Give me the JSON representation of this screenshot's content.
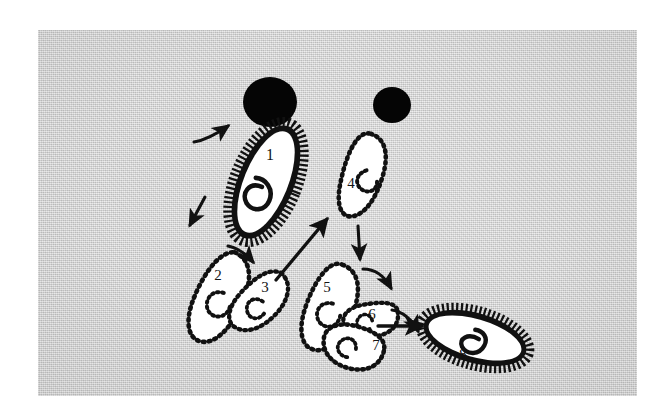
{
  "figure": {
    "kind": "micrograph-diagram",
    "background_color": "#cfcfcf",
    "ink_color": "#111111",
    "cell_fill_color": "#ffffff",
    "plate": {
      "x": 38,
      "y": 30,
      "width": 599,
      "height": 366
    }
  },
  "dark_bodies": [
    {
      "name": "dark-body-large",
      "label": "",
      "cx": 232,
      "cy": 72,
      "rx": 27,
      "ry": 25
    },
    {
      "name": "dark-body-small",
      "label": "",
      "cx": 354,
      "cy": 75,
      "rx": 19,
      "ry": 18
    }
  ],
  "cells": [
    {
      "id": 1,
      "label": "1",
      "border_style": "ciliated-solid",
      "label_x": 232,
      "label_y": 130,
      "description": "elongated ciliated cell with spiral macronucleus"
    },
    {
      "id": 2,
      "label": "2",
      "border_style": "dotted",
      "label_x": 180,
      "label_y": 250,
      "description": "dotted-outline dividing form, upper left of pair"
    },
    {
      "id": 3,
      "label": "3",
      "border_style": "dotted",
      "label_x": 227,
      "label_y": 262,
      "description": "dotted-outline dividing form, lower right of pair"
    },
    {
      "id": 4,
      "label": "4",
      "border_style": "dotted",
      "label_x": 313,
      "label_y": 158,
      "description": "crescent dotted-outline form with internal nucleus"
    },
    {
      "id": 5,
      "label": "5",
      "border_style": "dotted",
      "label_x": 289,
      "label_y": 262,
      "description": "dotted-outline form, upper left of cluster"
    },
    {
      "id": 6,
      "label": "6",
      "border_style": "dotted",
      "label_x": 334,
      "label_y": 289,
      "description": "dotted-outline form, middle right of cluster"
    },
    {
      "id": 7,
      "label": "7",
      "border_style": "dotted",
      "label_x": 338,
      "label_y": 320,
      "description": "dotted-outline form, lower of cluster"
    },
    {
      "id": 8,
      "label": "8",
      "border_style": "ciliated-solid",
      "label_x": 425,
      "label_y": 330,
      "description": "reformed ciliated cell with spiral macronucleus"
    }
  ],
  "arrows": [
    {
      "name": "arrow-into-1",
      "style": "curved-small",
      "from": "outside",
      "to": "1"
    },
    {
      "name": "arrow-1-to-2",
      "style": "straight-short",
      "from": "1",
      "to": "2"
    },
    {
      "name": "arrow-2-to-3",
      "style": "curved-small",
      "from": "2",
      "to": "3"
    },
    {
      "name": "arrow-3-to-4",
      "style": "straight-long",
      "from": "3",
      "to": "4"
    },
    {
      "name": "arrow-4-to-5",
      "style": "straight-short",
      "from": "4",
      "to": "5"
    },
    {
      "name": "arrow-5-to-6",
      "style": "curved-small",
      "from": "5",
      "to": "6"
    },
    {
      "name": "arrow-6-to-7",
      "style": "curved-small",
      "from": "6",
      "to": "7"
    },
    {
      "name": "arrow-7-to-8",
      "style": "straight-long",
      "from": "7",
      "to": "8"
    }
  ],
  "sequence_order": [
    "1",
    "2",
    "3",
    "4",
    "5",
    "6",
    "7",
    "8"
  ]
}
